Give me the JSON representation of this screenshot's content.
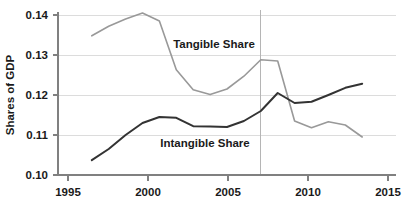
{
  "chart_data": {
    "type": "line",
    "title": "",
    "subtitle": "",
    "xlabel": "",
    "ylabel": "Shares of GDP",
    "xlim": [
      1995,
      2015
    ],
    "ylim": [
      0.1,
      0.14
    ],
    "xticks": [
      1995,
      2000,
      2005,
      2010,
      2015
    ],
    "xticklabels": [
      "1995",
      "2000",
      "2005",
      "2010",
      "2015"
    ],
    "yticks": [
      0.1,
      0.11,
      0.12,
      0.13,
      0.14
    ],
    "yticklabels": [
      "0.10",
      "0.11",
      "0.12",
      "0.13",
      "0.14"
    ],
    "grid": "horizontal",
    "legend_position": "inline-annotations",
    "annotations": [
      {
        "text": "Tangible Share",
        "x": 2005.0,
        "y": 0.1333,
        "series": "Tangible Share"
      },
      {
        "text": "Intangible Share",
        "x": 2003.6,
        "y": 0.1095,
        "series": "Intangible Share"
      }
    ],
    "reference_lines": [
      {
        "orientation": "vertical",
        "x": 2007,
        "color": "#b5b5b5",
        "label": ""
      }
    ],
    "x": [
      1997,
      1998,
      1999,
      2000,
      2001,
      2002,
      2003,
      2004,
      2005,
      2006,
      2007,
      2008,
      2009,
      2010,
      2011,
      2012,
      2013
    ],
    "series": [
      {
        "name": "Tangible Share",
        "color": "#999999",
        "linewidth": 1.6,
        "values": [
          0.1348,
          0.1372,
          0.139,
          0.1405,
          0.1385,
          0.1263,
          0.1213,
          0.1201,
          0.1215,
          0.1247,
          0.1288,
          0.1285,
          0.1135,
          0.1118,
          0.1133,
          0.1125,
          0.1095
        ]
      },
      {
        "name": "Intangible Share",
        "color": "#333333",
        "linewidth": 2.0,
        "values": [
          0.1037,
          0.1065,
          0.11,
          0.113,
          0.1145,
          0.1143,
          0.1122,
          0.1121,
          0.112,
          0.1135,
          0.116,
          0.1205,
          0.118,
          0.1183,
          0.12,
          0.1218,
          0.1228
        ]
      }
    ]
  },
  "colors": {
    "background": "#ffffff",
    "grid": "#d8d8d8",
    "axis": "#808080",
    "text": "#1a1a1a",
    "tangible": "#999999",
    "intangible": "#333333",
    "reference": "#b5b5b5"
  }
}
